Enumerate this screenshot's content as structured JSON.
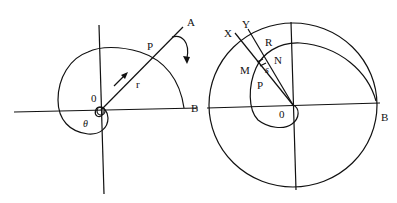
{
  "figures": [
    {
      "id": "left",
      "description": "Polar spiral curve from origin O through P to B, radius vector r along line OA, angle theta",
      "labels": {
        "A": "A",
        "P": "P",
        "B": "B",
        "O": "0",
        "r": "r",
        "theta": "θ"
      }
    },
    {
      "id": "right",
      "description": "Spiral inside circle of radius OB with radial lines OX and OY, small element between M, N, R",
      "labels": {
        "X": "X",
        "Y": "Y",
        "R": "R",
        "N": "N",
        "M": "M",
        "s": "s",
        "P": "P",
        "O": "0",
        "B": "B"
      }
    }
  ],
  "colors": {
    "stroke": "#111111",
    "background": "#ffffff"
  }
}
